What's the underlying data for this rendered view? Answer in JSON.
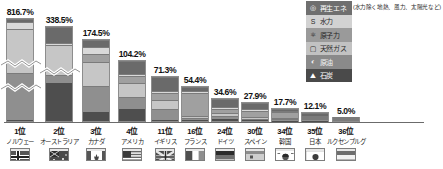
{
  "legend": {
    "title_note": "(水力除く地熱、風力、太陽光など)",
    "items": [
      {
        "label": "再生エネ",
        "icon": "renewable-icon",
        "glyph": "◎",
        "key": "renew"
      },
      {
        "label": "水力",
        "icon": "hydro-icon",
        "glyph": "S",
        "key": "hydro"
      },
      {
        "label": "原子力",
        "icon": "nuclear-icon",
        "glyph": "⚛",
        "key": "nuke"
      },
      {
        "label": "天然ガス",
        "icon": "gas-icon",
        "glyph": "▢",
        "key": "gas"
      },
      {
        "label": "原油",
        "icon": "oil-icon",
        "glyph": "◐",
        "key": "oil"
      },
      {
        "label": "石炭",
        "icon": "coal-icon",
        "glyph": "⛰",
        "key": "coal"
      }
    ]
  },
  "chart_data": {
    "type": "bar",
    "title": "",
    "xlabel": "",
    "ylabel": "",
    "ylim": [
      0,
      180
    ],
    "grid": false,
    "legend_position": "top-right",
    "note": "棒は軸の途中を波線で省略（上位2か国）",
    "categories": [
      "ノルウェー",
      "オーストラリア",
      "カナダ",
      "アメリカ",
      "イギリス",
      "フランス",
      "ドイツ",
      "スペイン",
      "韓国",
      "日本",
      "ルクセンブルグ"
    ],
    "ranks": [
      "1位",
      "2位",
      "3位",
      "4位",
      "11位",
      "16位",
      "24位",
      "30位",
      "34位",
      "35位",
      "36位"
    ],
    "values": [
      816.7,
      338.5,
      174.5,
      104.2,
      71.3,
      54.4,
      34.6,
      27.9,
      17.7,
      12.1,
      5.0
    ],
    "value_labels": [
      "816.7%",
      "338.5%",
      "174.5%",
      "104.2%",
      "71.3%",
      "54.4%",
      "34.6%",
      "27.9%",
      "17.7%",
      "12.1%",
      "5.0%"
    ],
    "series": [
      {
        "name": "石炭",
        "key": "coal",
        "values": [
          1.5,
          42.0,
          12.0,
          23.0,
          2.0,
          0.5,
          5.0,
          0.8,
          1.0,
          0.6,
          0.2
        ]
      },
      {
        "name": "原油",
        "key": "oil",
        "values": [
          46.0,
          8.0,
          33.0,
          20.0,
          18.0,
          1.0,
          2.5,
          0.6,
          0.5,
          0.3,
          0.2
        ]
      },
      {
        "name": "天然ガス",
        "key": "gas",
        "values": [
          44.0,
          33.0,
          30.0,
          26.0,
          16.0,
          0.5,
          4.0,
          0.5,
          0.5,
          0.3,
          0.2
        ]
      },
      {
        "name": "原子力",
        "key": "nuke",
        "values": [
          0.0,
          0.0,
          9.0,
          10.0,
          10.0,
          44.0,
          7.0,
          12.0,
          14.0,
          0.3,
          0.0
        ]
      },
      {
        "name": "水力",
        "key": "hydro",
        "values": [
          6.0,
          1.0,
          9.0,
          3.0,
          0.5,
          2.0,
          1.0,
          2.0,
          0.2,
          1.5,
          0.3
        ]
      },
      {
        "name": "再生エネ",
        "key": "renew",
        "values": [
          2.5,
          16.5,
          7.5,
          22.2,
          24.8,
          6.4,
          15.1,
          12.0,
          1.5,
          9.1,
          4.1
        ]
      }
    ]
  },
  "flags": {
    "ノルウェー": "flag-norway",
    "オーストラリア": "flag-australia",
    "カナダ": "flag-canada",
    "アメリカ": "flag-usa",
    "イギリス": "flag-uk",
    "フランス": "flag-france",
    "ドイツ": "flag-germany",
    "スペイン": "flag-spain",
    "韓国": "flag-korea",
    "日本": "flag-japan",
    "ルクセンブルグ": "flag-luxembourg"
  }
}
